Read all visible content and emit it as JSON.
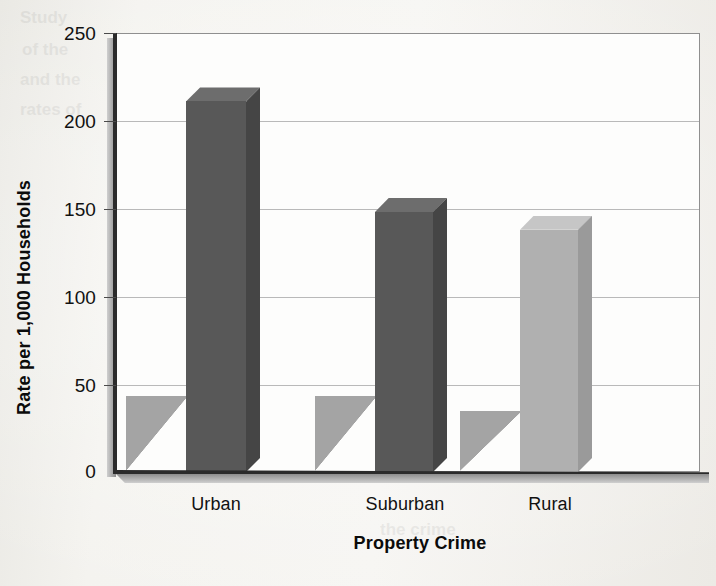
{
  "chart_data": {
    "type": "bar",
    "title": "",
    "xlabel": "Property Crime",
    "ylabel": "Rate per 1,000 Households",
    "categories": [
      "Urban",
      "Suburban",
      "Rural"
    ],
    "values": [
      211,
      148,
      138
    ],
    "ylim": [
      0,
      250
    ],
    "ytick_labels": [
      "0",
      "50",
      "100",
      "150",
      "200",
      "250"
    ],
    "ytick_values": [
      0,
      50,
      100,
      150,
      200,
      250
    ],
    "gridlines": [
      50,
      100,
      150,
      200
    ],
    "grid": true,
    "legend": "none",
    "style": "3d-bar",
    "series": [
      {
        "name": "Property Crime",
        "values": [
          211,
          148,
          138
        ],
        "bar_colors": [
          "#585858",
          "#585858",
          "#b0b0b0"
        ]
      }
    ],
    "colors": {
      "bar_dark": "#585858",
      "bar_dark_top": "#6f6f6f",
      "bar_dark_side": "#464646",
      "bar_light": "#b0b0b0",
      "bar_light_top": "#c4c4c4",
      "bar_light_side": "#9a9a9a",
      "shadow": "#a9a9a9",
      "gridline": "#b9b9b9",
      "axis": "#2b2b2b",
      "plot_background": "#fdfdfc",
      "page_background": "#efeeea",
      "text": "#111111"
    }
  },
  "axis": {
    "y_title": "Rate per 1,000 Households",
    "x_title": "Property Crime",
    "y_ticks": [
      "250",
      "200",
      "150",
      "100",
      "50",
      "0"
    ],
    "x_ticks": [
      "Urban",
      "Suburban",
      "Rural"
    ]
  },
  "bleed_text": {
    "lines": [
      "Study",
      "of the",
      "and the",
      "rates of",
      "in rural",
      "the",
      "Because",
      "national",
      "Victimization",
      "the crime"
    ]
  }
}
